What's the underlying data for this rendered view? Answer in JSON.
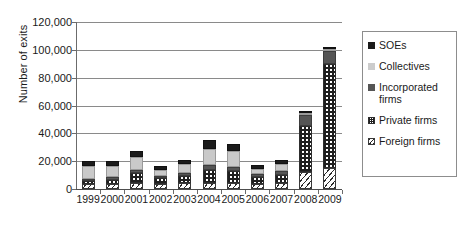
{
  "chart_data": {
    "type": "bar",
    "stacked": true,
    "title": "",
    "xlabel": "",
    "ylabel": "Number of exits",
    "ylim": [
      0,
      120000
    ],
    "ytick_step": 20000,
    "ytick_labels": [
      "0",
      "20,000",
      "40,000",
      "60,000",
      "80,000",
      "100,000",
      "120,000"
    ],
    "ytick_values": [
      0,
      20000,
      40000,
      60000,
      80000,
      100000,
      120000
    ],
    "grid": "horizontal",
    "legend_position": "right",
    "categories": [
      "1999",
      "2000",
      "2001",
      "2002",
      "2003",
      "2004",
      "2005",
      "2006",
      "2007",
      "2008",
      "2009"
    ],
    "series": [
      {
        "name": "Foreign firms",
        "color": "#ffffff",
        "pattern": "diagonal-hatch",
        "values": [
          3500,
          3800,
          4200,
          3600,
          4000,
          4500,
          4300,
          3800,
          4200,
          12000,
          15000
        ]
      },
      {
        "name": "Private firms",
        "color": "#ffffff",
        "pattern": "checkerboard",
        "values": [
          2500,
          2800,
          7000,
          4000,
          5500,
          9000,
          8500,
          5000,
          6000,
          33000,
          75000
        ]
      },
      {
        "name": "Incorporated firms",
        "color": "#555555",
        "pattern": "solid",
        "values": [
          1500,
          1800,
          2500,
          1800,
          2200,
          3500,
          3200,
          2200,
          2500,
          8000,
          9500
        ]
      },
      {
        "name": "Collectives",
        "color": "#c9c9c9",
        "pattern": "solid",
        "values": [
          9000,
          8000,
          9000,
          4500,
          6500,
          12000,
          11000,
          3500,
          5500,
          1500,
          500
        ]
      },
      {
        "name": "SOEs",
        "color": "#1b1b1b",
        "pattern": "solid",
        "values": [
          4000,
          4000,
          4500,
          2500,
          3000,
          6000,
          5500,
          2500,
          2500,
          1000,
          500
        ]
      }
    ],
    "totals": [
      20500,
      20400,
      27200,
      16400,
      21200,
      35000,
      32500,
      17000,
      20700,
      55500,
      100500
    ],
    "legend_entries": [
      "SOEs",
      "Collectives",
      "Incorporated firms",
      "Private firms",
      "Foreign firms"
    ]
  }
}
